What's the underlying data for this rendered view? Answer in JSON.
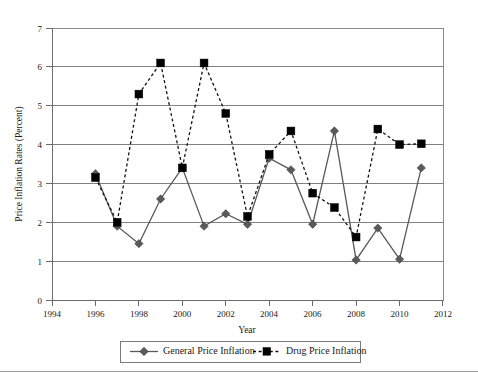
{
  "chart_data": {
    "type": "line",
    "title": "",
    "xlabel": "Year",
    "ylabel": "Price Inflation Rates (Percent)",
    "xlim": [
      1994,
      2012
    ],
    "ylim": [
      0,
      7
    ],
    "xticks": [
      1994,
      1996,
      1998,
      2000,
      2002,
      2004,
      2006,
      2008,
      2010,
      2012
    ],
    "yticks": [
      0,
      1,
      2,
      3,
      4,
      5,
      6,
      7
    ],
    "grid": "horizontal",
    "legend_position": "bottom",
    "x": [
      1996,
      1997,
      1998,
      1999,
      2000,
      2001,
      2002,
      2003,
      2004,
      2005,
      2006,
      2007,
      2008,
      2009,
      2010,
      2011
    ],
    "series": [
      {
        "name": "General Price Inflation",
        "marker": "diamond",
        "linestyle": "solid",
        "color": "#5a5a5a",
        "values": [
          3.25,
          1.9,
          1.45,
          2.6,
          3.4,
          1.9,
          2.22,
          1.95,
          3.65,
          3.35,
          1.95,
          4.35,
          1.03,
          1.85,
          1.05,
          3.4
        ]
      },
      {
        "name": "Drug Price Inflation",
        "marker": "square",
        "linestyle": "dashed",
        "color": "#000000",
        "values": [
          3.15,
          2.0,
          5.3,
          6.1,
          3.4,
          6.1,
          4.8,
          2.15,
          3.75,
          4.35,
          2.75,
          2.38,
          1.62,
          4.4,
          4.0,
          4.02
        ]
      }
    ]
  },
  "axis": {
    "ylabel": "Price Inflation Rates (Percent)",
    "xlabel": "Year",
    "ytick_labels": [
      "0",
      "1",
      "2",
      "3",
      "4",
      "5",
      "6",
      "7"
    ],
    "xtick_labels": [
      "1994",
      "1996",
      "1998",
      "2000",
      "2002",
      "2004",
      "2006",
      "2008",
      "2010",
      "2012"
    ]
  },
  "legend": {
    "entries": [
      {
        "label": "General Price Inflation",
        "marker": "diamond-marker",
        "style": "solid"
      },
      {
        "label": "Drug Price Inflation",
        "marker": "square-marker",
        "style": "dashed"
      }
    ]
  },
  "colors": {
    "general": "#5a5a5a",
    "drug": "#000000",
    "grid": "#808080",
    "border": "#8a8a8a",
    "background": "#ffffff"
  }
}
